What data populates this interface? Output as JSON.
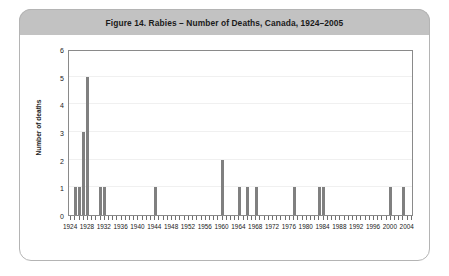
{
  "figure": {
    "title": "Figure 14.  Rabies – Number of Deaths, Canada, 1924–2005",
    "frame_color": "#b4b4b4",
    "title_bar_color": "#c2c2c2"
  },
  "chart_data": {
    "type": "bar",
    "title": "Figure 14.  Rabies – Number of Deaths, Canada, 1924–2005",
    "xlabel": "",
    "ylabel": "Number of deaths",
    "ylim": [
      0,
      6
    ],
    "xlim": [
      1923.5,
      2005.5
    ],
    "ytick_labels": [
      "0",
      "1",
      "2",
      "3",
      "4",
      "5",
      "6"
    ],
    "ytick_values": [
      0,
      1,
      2,
      3,
      4,
      5,
      6
    ],
    "xtick_labels": [
      "1924",
      "1928",
      "1932",
      "1936",
      "1940",
      "1944",
      "1948",
      "1952",
      "1956",
      "1960",
      "1964",
      "1968",
      "1972",
      "1976",
      "1980",
      "1984",
      "1988",
      "1992",
      "1996",
      "2000",
      "2004"
    ],
    "xtick_values": [
      1924,
      1928,
      1932,
      1936,
      1940,
      1944,
      1948,
      1952,
      1956,
      1960,
      1964,
      1968,
      1972,
      1976,
      1980,
      1984,
      1988,
      1992,
      1996,
      2000,
      2004
    ],
    "grid": true,
    "legend": null,
    "bar_color": "#808080",
    "categories": [
      1924,
      1925,
      1926,
      1927,
      1928,
      1929,
      1930,
      1931,
      1932,
      1933,
      1934,
      1935,
      1936,
      1937,
      1938,
      1939,
      1940,
      1941,
      1942,
      1943,
      1944,
      1945,
      1946,
      1947,
      1948,
      1949,
      1950,
      1951,
      1952,
      1953,
      1954,
      1955,
      1956,
      1957,
      1958,
      1959,
      1960,
      1961,
      1962,
      1963,
      1964,
      1965,
      1966,
      1967,
      1968,
      1969,
      1970,
      1971,
      1972,
      1973,
      1974,
      1975,
      1976,
      1977,
      1978,
      1979,
      1980,
      1981,
      1982,
      1983,
      1984,
      1985,
      1986,
      1987,
      1988,
      1989,
      1990,
      1991,
      1992,
      1993,
      1994,
      1995,
      1996,
      1997,
      1998,
      1999,
      2000,
      2001,
      2002,
      2003,
      2004,
      2005
    ],
    "values": [
      0,
      1,
      1,
      3,
      5,
      0,
      0,
      1,
      1,
      0,
      0,
      0,
      0,
      0,
      0,
      0,
      0,
      0,
      0,
      0,
      1,
      0,
      0,
      0,
      0,
      0,
      0,
      0,
      0,
      0,
      0,
      0,
      0,
      0,
      0,
      0,
      2,
      0,
      0,
      0,
      1,
      0,
      1,
      0,
      1,
      0,
      0,
      0,
      0,
      0,
      0,
      0,
      0,
      1,
      0,
      0,
      0,
      0,
      0,
      1,
      1,
      0,
      0,
      0,
      0,
      0,
      0,
      0,
      0,
      0,
      0,
      0,
      0,
      0,
      0,
      0,
      1,
      0,
      0,
      1,
      0,
      0
    ],
    "nonzero_points": [
      {
        "year": 1925,
        "deaths": 1
      },
      {
        "year": 1926,
        "deaths": 1
      },
      {
        "year": 1927,
        "deaths": 3
      },
      {
        "year": 1928,
        "deaths": 5
      },
      {
        "year": 1931,
        "deaths": 1
      },
      {
        "year": 1932,
        "deaths": 1
      },
      {
        "year": 1944,
        "deaths": 1
      },
      {
        "year": 1960,
        "deaths": 2
      },
      {
        "year": 1964,
        "deaths": 1
      },
      {
        "year": 1966,
        "deaths": 1
      },
      {
        "year": 1968,
        "deaths": 1
      },
      {
        "year": 1977,
        "deaths": 1
      },
      {
        "year": 1983,
        "deaths": 1
      },
      {
        "year": 1984,
        "deaths": 1
      },
      {
        "year": 2000,
        "deaths": 1
      },
      {
        "year": 2003,
        "deaths": 1
      }
    ]
  }
}
